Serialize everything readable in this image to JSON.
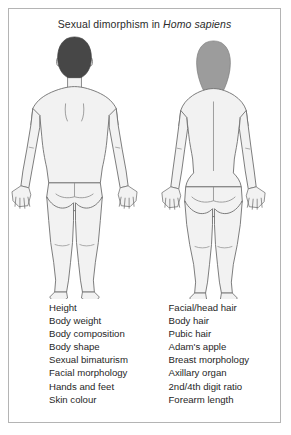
{
  "figure": {
    "title_prefix": "Sexual dimorphism in ",
    "title_species": "Homo sapiens",
    "border_color": "#b4b4b4",
    "background_color": "#ffffff"
  },
  "figures": {
    "male": {
      "label": "male-figure",
      "view": "posterior",
      "hair_color": "#474747",
      "skin_fill": "#f2f2f2",
      "outline_color": "#6e6e6e"
    },
    "female": {
      "label": "female-figure",
      "view": "posterior",
      "hair_color": "#9c9c9c",
      "skin_fill": "#f2f2f2",
      "outline_color": "#6e6e6e"
    }
  },
  "traits": {
    "male_column": [
      "Height",
      "Body weight",
      "Body composition",
      "Body shape",
      "Sexual bimaturism",
      "Facial morphology",
      "Hands and feet",
      "Skin colour"
    ],
    "female_column": [
      "Facial/head hair",
      "Body hair",
      "Pubic hair",
      "Adam's apple",
      "Breast morphology",
      "Axillary organ",
      "2nd/4th digit ratio",
      "Forearm length"
    ]
  }
}
